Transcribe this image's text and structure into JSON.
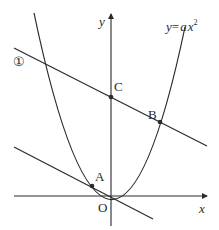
{
  "diagram": {
    "axes": {
      "x_label": "x",
      "y_label": "y",
      "origin_label": "O"
    },
    "curve": {
      "label": "y = ax²",
      "label_parts": {
        "lhs": "y",
        "eq": "=",
        "a": "a",
        "x": "x",
        "exp": "2"
      }
    },
    "line1": {
      "label": "①"
    },
    "points": [
      {
        "name": "A",
        "label": "A"
      },
      {
        "name": "B",
        "label": "B"
      },
      {
        "name": "C",
        "label": "C"
      }
    ],
    "colors": {
      "stroke": "#2a2a2a",
      "background": "#ffffff"
    }
  }
}
